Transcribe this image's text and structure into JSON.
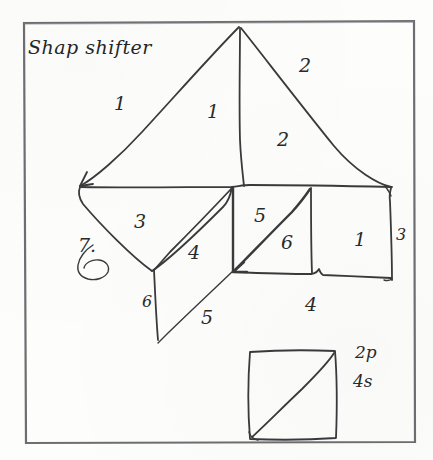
{
  "page": {
    "title": "Shap shifter",
    "background_color": "#fdfdfc",
    "ink_color": "#3a3a3c",
    "frame_color": "#6e6e72",
    "width": 433,
    "height": 460
  },
  "labels": {
    "sail_left_outer": "1",
    "sail_left_inner": "1",
    "sail_right_outer": "2",
    "sail_right_inner": "2",
    "hull_left_triangle": "3",
    "hull_parallelogram": "4",
    "hull_square_upper": "5",
    "hull_square_lower": "6",
    "hull_right_square": "1",
    "edge_right": "3",
    "edge_bottom_left": "6",
    "edge_bottom_mid": "5",
    "edge_bottom_right": "4",
    "count_marker": "7."
  },
  "legend": {
    "line_one": "2p",
    "line_two": "4s"
  },
  "shapes": {
    "outer_frame": "rectangle-border",
    "main_figure": "tangram-sailboat",
    "inset": "square-with-diagonal",
    "annotation_loop": "circle-scribble"
  }
}
